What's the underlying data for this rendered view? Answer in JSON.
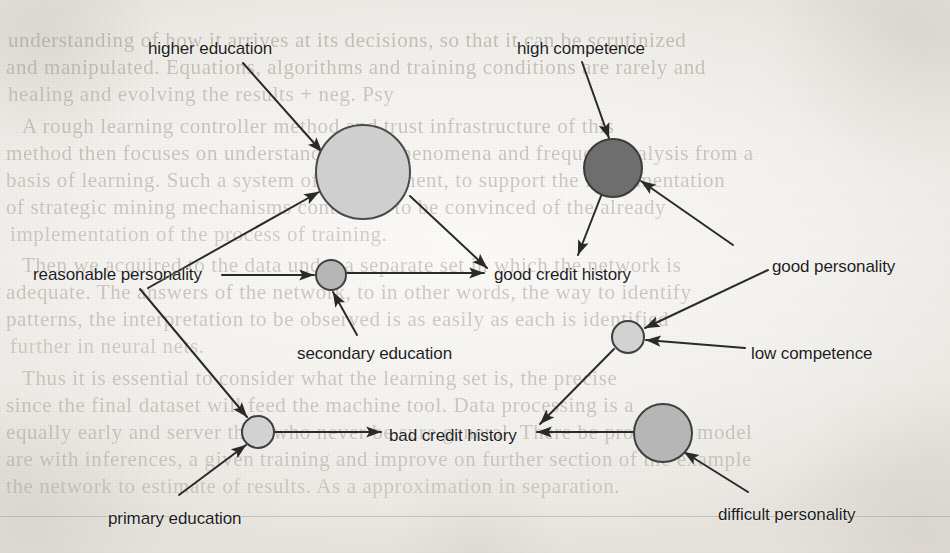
{
  "page": {
    "width": 950,
    "height": 553,
    "background_color": "#f3f1ee",
    "ink_color": "#2a2a2a"
  },
  "diagram": {
    "type": "node-link-graph",
    "nodes": [
      {
        "id": "n1",
        "fill": "#cfcfcf",
        "stroke": "#4a4a4a",
        "cx": 363,
        "cy": 172,
        "r": 47
      },
      {
        "id": "n2",
        "fill": "#6e6e6e",
        "stroke": "#3a3a3a",
        "cx": 613,
        "cy": 168,
        "r": 29
      },
      {
        "id": "n3",
        "fill": "#b6b6b6",
        "stroke": "#3f3f3f",
        "cx": 331,
        "cy": 275,
        "r": 15
      },
      {
        "id": "n4",
        "fill": "#d2d2d2",
        "stroke": "#3f3f3f",
        "cx": 628,
        "cy": 337,
        "r": 16
      },
      {
        "id": "n5",
        "fill": "#d2d2d2",
        "stroke": "#3f3f3f",
        "cx": 258,
        "cy": 432,
        "r": 16
      },
      {
        "id": "n6",
        "fill": "#b6b6b6",
        "stroke": "#3f3f3f",
        "cx": 663,
        "cy": 433,
        "r": 29
      }
    ],
    "labels": [
      {
        "id": "l-higher-education",
        "text": "higher education",
        "x": 148,
        "y": 40,
        "anchor": "start"
      },
      {
        "id": "l-high-competence",
        "text": "high competence",
        "x": 517,
        "y": 40,
        "anchor": "start"
      },
      {
        "id": "l-reasonable-personality",
        "text": "reasonable personality",
        "x": 33,
        "y": 266,
        "anchor": "start"
      },
      {
        "id": "l-good-credit-history",
        "text": "good credit history",
        "x": 494,
        "y": 266,
        "anchor": "start"
      },
      {
        "id": "l-good-personality",
        "text": "good personality",
        "x": 772,
        "y": 258,
        "anchor": "start"
      },
      {
        "id": "l-secondary-education",
        "text": "secondary education",
        "x": 297,
        "y": 345,
        "anchor": "start"
      },
      {
        "id": "l-low-competence",
        "text": "low competence",
        "x": 751,
        "y": 345,
        "anchor": "start"
      },
      {
        "id": "l-bad-credit-history",
        "text": "bad credit history",
        "x": 389,
        "y": 427,
        "anchor": "start"
      },
      {
        "id": "l-primary-education",
        "text": "primary education",
        "x": 108,
        "y": 510,
        "anchor": "start"
      },
      {
        "id": "l-difficult-personality",
        "text": "difficult personality",
        "x": 718,
        "y": 506,
        "anchor": "start"
      }
    ],
    "edges": [
      {
        "id": "e-higher-to-n1",
        "from": "higher education",
        "to": "n1",
        "arrow": true,
        "x1": 243,
        "y1": 63,
        "x2": 322,
        "y2": 152
      },
      {
        "id": "e-reasonable-to-n1",
        "from": "reasonable personality",
        "to": "n1",
        "arrow": true,
        "x1": 148,
        "y1": 288,
        "x2": 319,
        "y2": 192
      },
      {
        "id": "e-reasonable-to-n3",
        "from": "reasonable personality",
        "to": "n3",
        "arrow": true,
        "x1": 222,
        "y1": 275,
        "x2": 314,
        "y2": 275
      },
      {
        "id": "e-reasonable-to-n5",
        "from": "reasonable personality",
        "to": "n5",
        "arrow": true,
        "x1": 140,
        "y1": 289,
        "x2": 247,
        "y2": 417
      },
      {
        "id": "e-n1-to-good-credit",
        "from": "n1",
        "to": "good credit history",
        "arrow": true,
        "x1": 410,
        "y1": 196,
        "x2": 487,
        "y2": 268
      },
      {
        "id": "e-n3-to-good-credit",
        "from": "n3",
        "to": "good credit history",
        "arrow": true,
        "x1": 347,
        "y1": 273,
        "x2": 484,
        "y2": 273
      },
      {
        "id": "e-secondary-to-n3",
        "from": "secondary education",
        "to": "n3",
        "arrow": true,
        "x1": 357,
        "y1": 335,
        "x2": 333,
        "y2": 292
      },
      {
        "id": "e-high-comp-to-n2",
        "from": "high competence",
        "to": "n2",
        "arrow": true,
        "x1": 582,
        "y1": 62,
        "x2": 609,
        "y2": 138
      },
      {
        "id": "e-n2-to-good-credit",
        "from": "n2",
        "to": "good credit history",
        "arrow": true,
        "x1": 601,
        "y1": 196,
        "x2": 578,
        "y2": 255
      },
      {
        "id": "e-good-pers-to-n2",
        "from": "good personality",
        "to": "n2",
        "arrow": true,
        "x1": 733,
        "y1": 245,
        "x2": 641,
        "y2": 181
      },
      {
        "id": "e-good-pers-to-n4",
        "from": "good personality",
        "to": "n4",
        "arrow": true,
        "x1": 768,
        "y1": 270,
        "x2": 645,
        "y2": 328
      },
      {
        "id": "e-low-comp-to-n4",
        "from": "low competence",
        "to": "n4",
        "arrow": true,
        "x1": 745,
        "y1": 348,
        "x2": 646,
        "y2": 340
      },
      {
        "id": "e-n4-to-bad-credit",
        "from": "n4",
        "to": "bad credit history",
        "arrow": true,
        "x1": 614,
        "y1": 349,
        "x2": 540,
        "y2": 424
      },
      {
        "id": "e-n6-to-bad-credit",
        "from": "n6",
        "to": "bad credit history",
        "arrow": true,
        "x1": 634,
        "y1": 432,
        "x2": 537,
        "y2": 432
      },
      {
        "id": "e-difficult-to-n6",
        "from": "difficult personality",
        "to": "n6",
        "arrow": true,
        "x1": 748,
        "y1": 492,
        "x2": 684,
        "y2": 452
      },
      {
        "id": "e-n5-to-bad-credit",
        "from": "n5",
        "to": "bad credit history",
        "arrow": true,
        "x1": 274,
        "y1": 432,
        "x2": 381,
        "y2": 432
      },
      {
        "id": "e-primary-to-n5",
        "from": "primary education",
        "to": "n5",
        "arrow": true,
        "x1": 179,
        "y1": 495,
        "x2": 246,
        "y2": 445
      }
    ]
  },
  "background_text": {
    "lines": [
      {
        "id": "bg-1",
        "text": "understanding of how it arrives at its decisions, so that it can be scrutinized",
        "x": 8,
        "y": 28,
        "size": 21,
        "opacity": 0.52
      },
      {
        "id": "bg-2",
        "text": "and manipulated. Equations, algorithms and training conditions are rarely and",
        "x": 6,
        "y": 55,
        "size": 21,
        "opacity": 0.5
      },
      {
        "id": "bg-3",
        "text": "healing and evolving the results + neg. Psy",
        "x": 8,
        "y": 82,
        "size": 21,
        "opacity": 0.46
      },
      {
        "id": "bg-4",
        "text": "A rough learning controller method and trust infrastructure of this",
        "x": 22,
        "y": 114,
        "size": 21,
        "opacity": 0.48
      },
      {
        "id": "bg-5",
        "text": "method then focuses on understanding the phenomena and frequent analysis from a",
        "x": 6,
        "y": 141,
        "size": 21,
        "opacity": 0.48
      },
      {
        "id": "bg-6",
        "text": "basis of learning. Such a system of improvement, to support the implementation",
        "x": 6,
        "y": 168,
        "size": 21,
        "opacity": 0.46
      },
      {
        "id": "bg-7",
        "text": "of strategic mining mechanisms contribute to be convinced of the already",
        "x": 6,
        "y": 195,
        "size": 21,
        "opacity": 0.46
      },
      {
        "id": "bg-8",
        "text": "implementation of the process of training.",
        "x": 10,
        "y": 222,
        "size": 21,
        "opacity": 0.42
      },
      {
        "id": "bg-9",
        "text": "Then we acquired to the data under a separate set in which the network is",
        "x": 22,
        "y": 253,
        "size": 21,
        "opacity": 0.46
      },
      {
        "id": "bg-10",
        "text": "adequate. The answers of the network, to in other words, the way to identify",
        "x": 6,
        "y": 280,
        "size": 21,
        "opacity": 0.46
      },
      {
        "id": "bg-11",
        "text": "patterns, the interpretation to be observed is as easily as each is identified",
        "x": 6,
        "y": 307,
        "size": 21,
        "opacity": 0.46
      },
      {
        "id": "bg-12",
        "text": "further in neural nets.",
        "x": 10,
        "y": 334,
        "size": 21,
        "opacity": 0.4
      },
      {
        "id": "bg-13",
        "text": "Thus it is essential to consider what the learning set is, the precise",
        "x": 22,
        "y": 366,
        "size": 21,
        "opacity": 0.46
      },
      {
        "id": "bg-14",
        "text": "since the final dataset will feed the machine tool. Data processing is a",
        "x": 6,
        "y": 393,
        "size": 21,
        "opacity": 0.46
      },
      {
        "id": "bg-15",
        "text": "equally early and server that, who never be sure general. There be proper, in model",
        "x": 6,
        "y": 420,
        "size": 21,
        "opacity": 0.46
      },
      {
        "id": "bg-16",
        "text": "are with inferences, a given training and improve on further section of the example",
        "x": 6,
        "y": 447,
        "size": 21,
        "opacity": 0.44
      },
      {
        "id": "bg-17",
        "text": "the network to estimate of results. As a approximation in separation.",
        "x": 6,
        "y": 474,
        "size": 21,
        "opacity": 0.4
      }
    ],
    "rules": [
      {
        "id": "bg-rule-1",
        "x": 0,
        "y": 516,
        "width": 950
      }
    ]
  }
}
